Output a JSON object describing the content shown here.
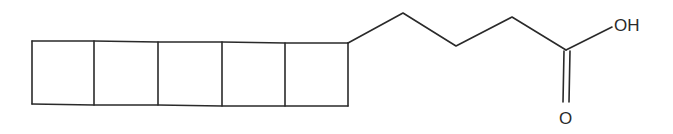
{
  "diagram": {
    "type": "skeletal-formula",
    "ring_count": 5,
    "ring_type": "fused cyclobutane ladder (ladderane)",
    "chain": "butanoic acid",
    "labels": {
      "hydroxyl": "OH",
      "carbonyl_oxygen": "O"
    },
    "colors": {
      "bond": "#2a2a2a",
      "background": "#ffffff"
    }
  }
}
